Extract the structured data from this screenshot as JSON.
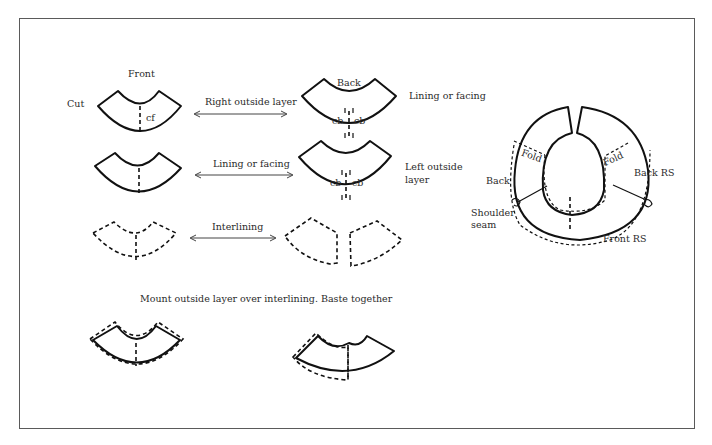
{
  "figure": {
    "column_labels": {
      "front": "Front",
      "back": "Back"
    },
    "row_label_cut": "Cut",
    "rows": [
      {
        "arrow_label": "Right outside layer",
        "right_label": "Lining or facing",
        "front_mark": "cf",
        "back_marks": [
          "cb",
          "cb"
        ]
      },
      {
        "arrow_label": "Lining or facing",
        "right_label_line1": "Left outside",
        "right_label_line2": "layer",
        "back_marks": [
          "cb",
          "cb"
        ]
      },
      {
        "arrow_label": "Interlining"
      }
    ],
    "mount_caption": "Mount outside layer over interlining. Baste together",
    "assembled": {
      "fold_left": "Fold",
      "fold_right": "Fold",
      "back": "Back",
      "back_rs": "Back RS",
      "shoulder_line1": "Shoulder",
      "shoulder_line2": "seam",
      "front_rs": "Front RS"
    }
  }
}
